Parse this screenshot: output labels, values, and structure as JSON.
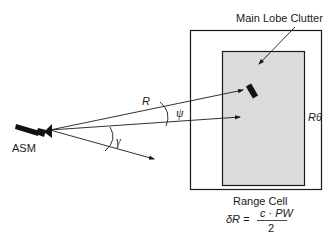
{
  "diagram": {
    "labels": {
      "main_lobe_clutter": "Main Lobe Clutter",
      "asm": "ASM",
      "range": "R",
      "psi": "ψ",
      "gamma": "γ",
      "r_theta": "Rθ",
      "range_cell": "Range Cell"
    },
    "formula": {
      "lhs": "δR =",
      "numerator": "c · PW",
      "denominator": "2"
    },
    "colors": {
      "line": "#1a1a1a",
      "cell_fill": "#dcdcdc",
      "background": "#ffffff"
    }
  }
}
